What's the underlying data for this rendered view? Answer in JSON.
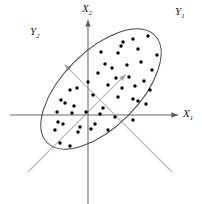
{
  "figure": {
    "width": 202,
    "height": 204,
    "background": "#ffffff"
  },
  "labels": {
    "x1": "X",
    "x1_sub": "1",
    "x2": "X",
    "x2_sub": "2",
    "y1": "Y",
    "y1_sub": "1",
    "y2": "Y",
    "y2_sub": "2"
  },
  "colors": {
    "original_axis": "#6b6b6b",
    "rotated_axis": "#b9b9b9",
    "ellipse": "#4a4a4a",
    "point": "#000000",
    "label_text": "#1a1a1a",
    "background": "#ffffff"
  },
  "chart_data": {
    "type": "scatter",
    "title": "",
    "xlabel": "X1",
    "ylabel": "X2",
    "grid": false,
    "legend": false,
    "origin_px": [
      88,
      115
    ],
    "axes": {
      "original": [
        {
          "name": "X1",
          "from_px": [
            10,
            115
          ],
          "to_px": [
            180,
            115
          ],
          "arrow": "end",
          "color": "#6b6b6b",
          "angle_deg": 0
        },
        {
          "name": "X2",
          "from_px": [
            88,
            204
          ],
          "to_px": [
            88,
            18
          ],
          "arrow": "end",
          "color": "#6b6b6b",
          "angle_deg": 90
        }
      ],
      "rotated": [
        {
          "name": "Y1",
          "from_px": [
            172,
            172
          ],
          "to_px": [
            173,
            18
          ],
          "arrow": "end",
          "color": "#b9b9b9",
          "angle_deg": 45
        },
        {
          "name": "Y2",
          "from_px": [
            28,
            172
          ],
          "to_px": [
            48,
            36
          ],
          "arrow": "end",
          "color": "#b9b9b9",
          "angle_deg": 135
        }
      ]
    },
    "ellipse": {
      "center_px": [
        101,
        89
      ],
      "semi_major_px": 76,
      "semi_minor_px": 38,
      "rotation_deg": -45,
      "stroke": "#4a4a4a",
      "stroke_width": 1,
      "fill": "none"
    },
    "points_px": [
      [
        123,
        42
      ],
      [
        121,
        46
      ],
      [
        133,
        39
      ],
      [
        148,
        36
      ],
      [
        101,
        52
      ],
      [
        118,
        53
      ],
      [
        138,
        49
      ],
      [
        157,
        55
      ],
      [
        105,
        64
      ],
      [
        112,
        68
      ],
      [
        127,
        65
      ],
      [
        141,
        62
      ],
      [
        152,
        70
      ],
      [
        98,
        73
      ],
      [
        116,
        78
      ],
      [
        129,
        77
      ],
      [
        144,
        81
      ],
      [
        88,
        82
      ],
      [
        108,
        85
      ],
      [
        122,
        88
      ],
      [
        135,
        86
      ],
      [
        150,
        90
      ],
      [
        70,
        90
      ],
      [
        77,
        88
      ],
      [
        93,
        95
      ],
      [
        118,
        97
      ],
      [
        133,
        99
      ],
      [
        138,
        101
      ],
      [
        61,
        100
      ],
      [
        65,
        103
      ],
      [
        74,
        106
      ],
      [
        103,
        108
      ],
      [
        146,
        104
      ],
      [
        57,
        112
      ],
      [
        72,
        113
      ],
      [
        86,
        112
      ],
      [
        100,
        114
      ],
      [
        115,
        117
      ],
      [
        58,
        122
      ],
      [
        63,
        124
      ],
      [
        80,
        127
      ],
      [
        95,
        124
      ],
      [
        133,
        120
      ],
      [
        55,
        130
      ],
      [
        78,
        132
      ],
      [
        91,
        129
      ],
      [
        108,
        130
      ],
      [
        60,
        143
      ],
      [
        70,
        146
      ]
    ],
    "point_radius_px": 1.7,
    "n_points": 49
  }
}
